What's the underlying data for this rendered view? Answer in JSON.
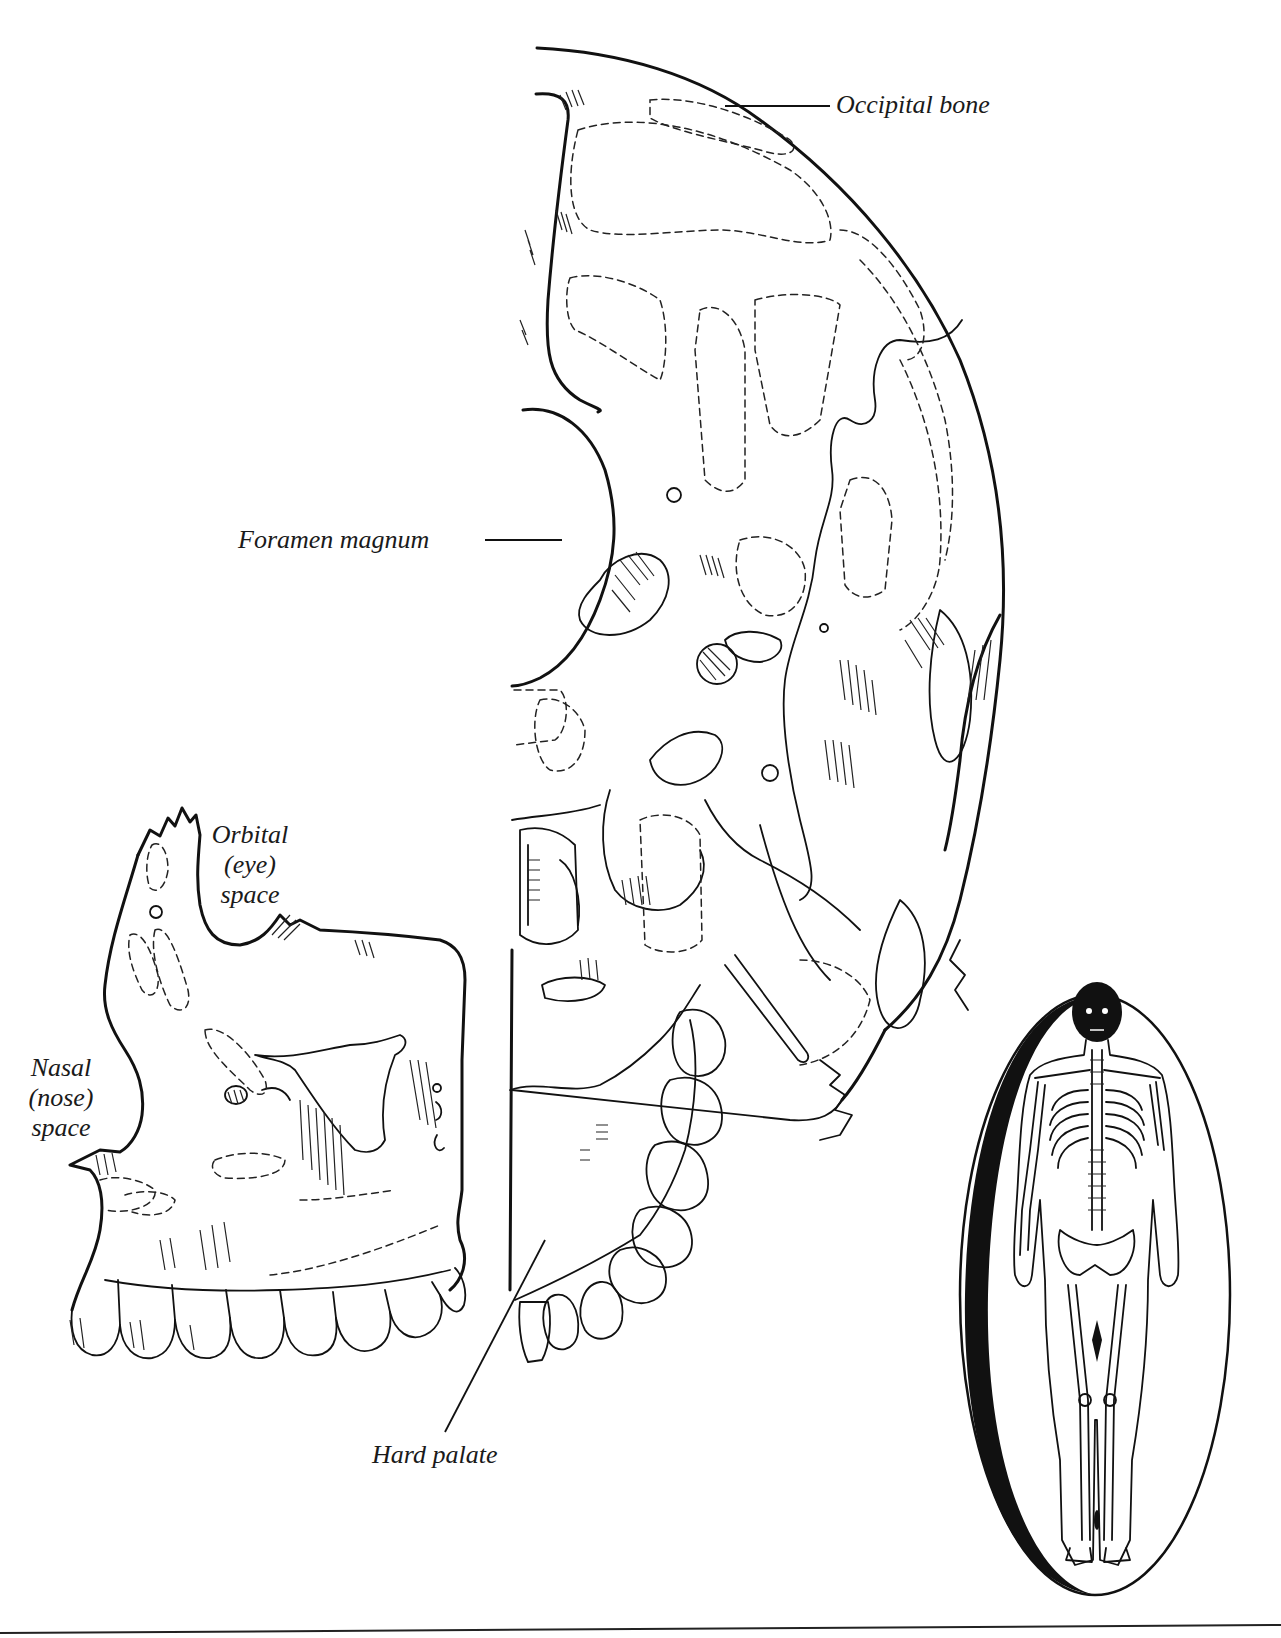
{
  "figure": {
    "type": "anatomical illustration",
    "colors": {
      "ink": "#111111",
      "background": "#ffffff"
    }
  },
  "labels": {
    "occipital_bone": "Occipital bone",
    "foramen_magnum": "Foramen magnum",
    "orbital_space": [
      "Orbital",
      "(eye)",
      "space"
    ],
    "nasal_space": [
      "Nasal",
      "(nose)",
      "space"
    ],
    "hard_palate": "Hard palate"
  },
  "inset": {
    "description": "full-body skeleton inside oval, skull highlighted in black"
  }
}
